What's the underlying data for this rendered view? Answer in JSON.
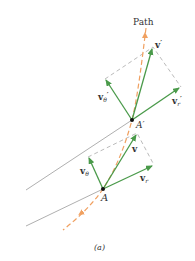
{
  "figure": {
    "path_label": "Path",
    "caption": "(a)",
    "points": {
      "A_label": "A",
      "A_prime_label": "A′"
    },
    "vectors_at_A_prime": {
      "v_label": "v",
      "v_sup": "′",
      "v_theta_label": "v",
      "v_theta_sub": "θ",
      "v_theta_sup": "′",
      "v_r_label": "v",
      "v_r_sub": "r",
      "v_r_sup": "′"
    },
    "vectors_at_A": {
      "v_label": "v",
      "v_theta_label": "v",
      "v_theta_sub": "θ",
      "v_r_label": "v",
      "v_r_sub": "r"
    },
    "colors": {
      "vector_green": "#4a9a4a",
      "path_orange": "#f0a060",
      "radial_gray": "#9a9a9a",
      "dashed_gray": "#a8a8a8",
      "text": "#333333"
    }
  }
}
